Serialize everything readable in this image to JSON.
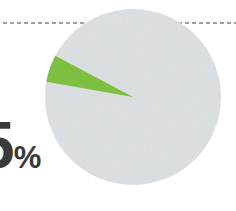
{
  "canvas": {
    "width": 236,
    "height": 211,
    "background_color": "#FFFFFF"
  },
  "callout": {
    "value_number": "5",
    "value_sign": "%",
    "value_full": "5%",
    "text_color": "#3A3A3A"
  },
  "divider": {
    "name": "dashed-rule",
    "color": "#9AA0A3",
    "y": 23,
    "dash": "4 3",
    "stroke_width": 2
  },
  "chart_data": {
    "type": "pie",
    "title": "",
    "subtitle": "",
    "xlabel": "",
    "ylabel": "",
    "grid": false,
    "legend_position": "none",
    "annotations": [
      "5%"
    ],
    "center": {
      "cx": 133,
      "cy": 97
    },
    "radius": 88,
    "start_angle_deg": 190,
    "categories": [
      "Highlighted share",
      "Remaining share"
    ],
    "values": [
      5,
      95
    ],
    "colors": [
      "#7FC241",
      "#DFE3E5"
    ],
    "slices": [
      {
        "label": "Highlighted share",
        "value": 5,
        "percent": "5%",
        "color": "#7FC241",
        "start_angle_deg": 190,
        "end_angle_deg": 208
      },
      {
        "label": "Remaining share",
        "value": 95,
        "percent": "95%",
        "color": "#DFE3E5",
        "start_angle_deg": 208,
        "end_angle_deg": 550
      }
    ]
  }
}
